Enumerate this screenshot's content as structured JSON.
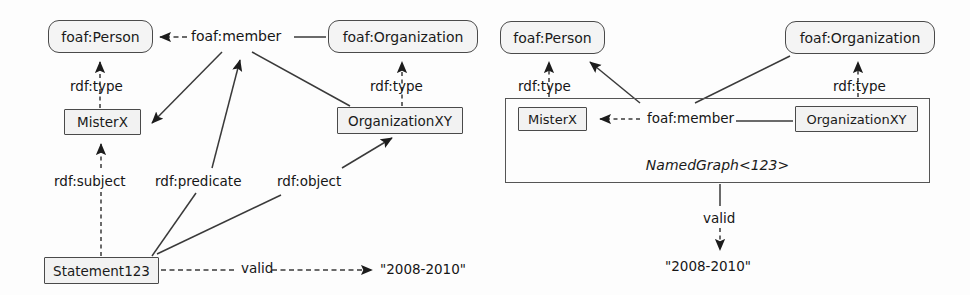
{
  "figure": {
    "panels": [
      {
        "id": "left",
        "name": "reification-diagram",
        "nodes": [
          {
            "id": "l-foaf-person",
            "label": "foaf:Person",
            "shape": "rounded",
            "x": 48,
            "y": 20,
            "w": 105,
            "h": 33
          },
          {
            "id": "l-foaf-org",
            "label": "foaf:Organization",
            "shape": "rounded",
            "x": 328,
            "y": 20,
            "w": 150,
            "h": 33
          },
          {
            "id": "l-misterx",
            "label": "MisterX",
            "shape": "rect",
            "x": 64,
            "y": 109,
            "w": 77,
            "h": 26
          },
          {
            "id": "l-orgxy",
            "label": "OrganizationXY",
            "shape": "rect",
            "x": 337,
            "y": 107,
            "w": 126,
            "h": 27
          },
          {
            "id": "l-statement",
            "label": "Statement123",
            "shape": "rect",
            "x": 44,
            "y": 257,
            "w": 115,
            "h": 27
          }
        ],
        "literals": [
          {
            "id": "l-literal",
            "label": "\"2008-2010\"",
            "x": 380,
            "y": 261
          }
        ],
        "edge_labels": [
          {
            "id": "l-member",
            "label": "foaf:member",
            "x": 191,
            "y": 29
          },
          {
            "id": "l-type-1",
            "label": "rdf:type",
            "x": 70,
            "y": 80
          },
          {
            "id": "l-type-2",
            "label": "rdf:type",
            "x": 370,
            "y": 80
          },
          {
            "id": "l-subject",
            "label": "rdf:subject",
            "x": 54,
            "y": 175
          },
          {
            "id": "l-predicate",
            "label": "rdf:predicate",
            "x": 155,
            "y": 175
          },
          {
            "id": "l-object",
            "label": "rdf:object",
            "x": 277,
            "y": 175
          },
          {
            "id": "l-valid",
            "label": "valid",
            "x": 241,
            "y": 261
          }
        ]
      },
      {
        "id": "right",
        "name": "named-graph-diagram",
        "nodes": [
          {
            "id": "r-foaf-person",
            "label": "foaf:Person",
            "shape": "rounded",
            "x": 500,
            "y": 21,
            "w": 105,
            "h": 33
          },
          {
            "id": "r-foaf-org",
            "label": "foaf:Organization",
            "shape": "rounded",
            "x": 785,
            "y": 21,
            "w": 150,
            "h": 33
          },
          {
            "id": "r-graph",
            "label": "NamedGraph<123>",
            "shape": "container",
            "x": 505,
            "y": 98,
            "w": 425,
            "h": 85
          },
          {
            "id": "r-misterx",
            "label": "MisterX",
            "shape": "rect",
            "x": 518,
            "y": 107,
            "w": 69,
            "h": 24
          },
          {
            "id": "r-orgxy",
            "label": "OrganizationXY",
            "shape": "rect",
            "x": 795,
            "y": 106,
            "w": 123,
            "h": 26
          }
        ],
        "literals": [
          {
            "id": "r-literal",
            "label": "\"2008-2010\"",
            "x": 665,
            "y": 258
          }
        ],
        "edge_labels": [
          {
            "id": "r-type-1",
            "label": "rdf:type",
            "x": 518,
            "y": 80
          },
          {
            "id": "r-type-2",
            "label": "rdf:type",
            "x": 833,
            "y": 80
          },
          {
            "id": "r-member",
            "label": "foaf:member",
            "x": 645,
            "y": 112
          },
          {
            "id": "r-valid",
            "label": "valid",
            "x": 703,
            "y": 212
          }
        ]
      }
    ],
    "colors": {
      "stroke": "#3a3a3a",
      "node_fill": "#f4f4f4",
      "text": "#161616",
      "background": "#ffffff"
    }
  }
}
